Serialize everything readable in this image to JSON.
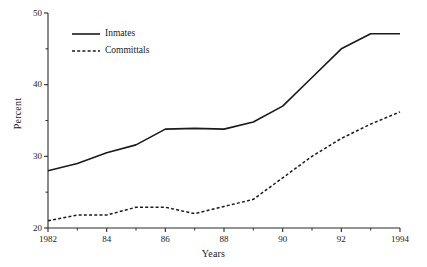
{
  "chart_data": {
    "type": "line",
    "title": "",
    "xlabel": "Years",
    "ylabel": "Percent",
    "xlim": [
      1982,
      1994
    ],
    "ylim": [
      20,
      50
    ],
    "grid": false,
    "legend_position": "top-left inside axes",
    "x": [
      1982,
      1983,
      1984,
      1985,
      1986,
      1987,
      1988,
      1989,
      1990,
      1991,
      1992,
      1993,
      1994
    ],
    "x_tick_values": [
      1982,
      1984,
      1986,
      1988,
      1990,
      1992,
      1994
    ],
    "x_tick_labels": [
      "1982",
      "84",
      "86",
      "88",
      "90",
      "92",
      "1994"
    ],
    "x_minor_tick_values": [
      1983,
      1985,
      1987,
      1989,
      1991,
      1993
    ],
    "y_tick_values": [
      20,
      30,
      40,
      50
    ],
    "y_tick_labels": [
      "20",
      "30",
      "40",
      "50"
    ],
    "y_minor_tick_values": [
      25,
      35,
      45
    ],
    "series": [
      {
        "name": "Inmates",
        "style": "solid",
        "color": "#1a1a1a",
        "values": [
          28.0,
          29.0,
          30.5,
          31.6,
          33.8,
          33.9,
          33.8,
          34.8,
          37.0,
          41.0,
          45.0,
          47.1,
          47.1
        ]
      },
      {
        "name": "Committals",
        "style": "dashed",
        "color": "#1a1a1a",
        "values": [
          21.0,
          21.8,
          21.8,
          22.9,
          22.9,
          22.0,
          23.0,
          24.0,
          27.0,
          30.0,
          32.5,
          34.5,
          36.2
        ]
      }
    ]
  },
  "legend": {
    "items": [
      {
        "label": "Inmates",
        "style": "solid"
      },
      {
        "label": "Committals",
        "style": "dashed"
      }
    ]
  },
  "axes": {
    "ylabel": "Percent",
    "xlabel": "Years"
  }
}
